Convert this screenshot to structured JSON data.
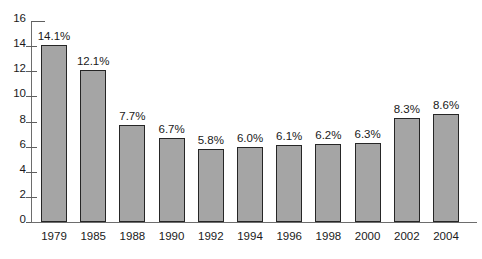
{
  "chart_data": {
    "type": "bar",
    "title": "",
    "subtitle": "",
    "xlabel": "",
    "ylabel": "",
    "ylim": [
      0,
      16
    ],
    "ytick_step": 2,
    "grid": false,
    "legend": null,
    "categories": [
      "1979",
      "1985",
      "1988",
      "1990",
      "1992",
      "1994",
      "1996",
      "1998",
      "2000",
      "2002",
      "2004"
    ],
    "values": [
      14.1,
      12.1,
      7.7,
      6.7,
      5.8,
      6.0,
      6.1,
      6.2,
      6.3,
      8.3,
      8.6
    ],
    "data_labels": [
      "14.1%",
      "12.1%",
      "7.7%",
      "6.7%",
      "5.8%",
      "6.0%",
      "6.1%",
      "6.2%",
      "6.3%",
      "8.3%",
      "8.6%"
    ],
    "y_tick_labels": [
      "16",
      "14",
      "12",
      "10",
      "8",
      "6",
      "4",
      "2",
      "0"
    ],
    "colors": {
      "bar_fill": "#a5a5a5",
      "bar_border": "#262626",
      "axis": "#6d6d6d",
      "text": "#1a1a1a",
      "background": "#ffffff"
    }
  }
}
